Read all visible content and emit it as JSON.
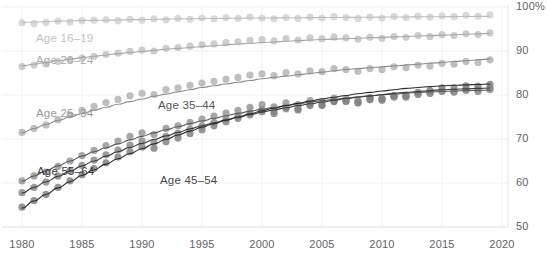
{
  "chart_data": {
    "type": "scatter",
    "title": "",
    "subtitle": "",
    "xlabel": "",
    "ylabel": "",
    "xlim": [
      1979,
      2020.5
    ],
    "ylim": [
      50,
      100
    ],
    "grid": true,
    "legend_position": "inline-labels",
    "y_ticks": [
      {
        "value": 100,
        "label": "100%"
      },
      {
        "value": 90,
        "label": "90"
      },
      {
        "value": 80,
        "label": "80"
      },
      {
        "value": 70,
        "label": "70"
      },
      {
        "value": 60,
        "label": "60"
      },
      {
        "value": 50,
        "label": "50"
      }
    ],
    "x_ticks": [
      {
        "value": 1980,
        "label": "1980"
      },
      {
        "value": 1985,
        "label": "1985"
      },
      {
        "value": 1990,
        "label": "1990"
      },
      {
        "value": 1995,
        "label": "1995"
      },
      {
        "value": 2000,
        "label": "2000"
      },
      {
        "value": 2005,
        "label": "2005"
      },
      {
        "value": 2010,
        "label": "2010"
      },
      {
        "value": 2015,
        "label": "2015"
      },
      {
        "value": 2020,
        "label": "2020"
      }
    ],
    "x": [
      1980,
      1981,
      1982,
      1983,
      1984,
      1985,
      1986,
      1987,
      1988,
      1989,
      1990,
      1991,
      1992,
      1993,
      1994,
      1995,
      1996,
      1997,
      1998,
      1999,
      2000,
      2001,
      2002,
      2003,
      2004,
      2005,
      2006,
      2007,
      2008,
      2009,
      2010,
      2011,
      2012,
      2013,
      2014,
      2015,
      2016,
      2017,
      2018,
      2019
    ],
    "series": [
      {
        "name": "Age 16-19",
        "label": "Age 16–19",
        "color": "#d2d2d4",
        "line_color": "#bdbdbf",
        "label_color": "#c2c2c4",
        "label_x": 36,
        "label_y": 32,
        "values": [
          96.4,
          96.2,
          96.5,
          96.8,
          96.6,
          96.9,
          97.0,
          97.1,
          96.9,
          97.2,
          97.0,
          97.3,
          97.1,
          97.4,
          97.2,
          97.5,
          97.3,
          97.6,
          97.4,
          97.7,
          97.5,
          97.3,
          97.6,
          97.4,
          97.7,
          97.5,
          97.8,
          97.6,
          97.4,
          97.7,
          97.5,
          97.8,
          97.6,
          97.9,
          97.7,
          98.0,
          97.8,
          98.1,
          97.9,
          98.2
        ],
        "fit": [
          96.5,
          96.6,
          96.7,
          96.8,
          96.85,
          96.9,
          96.95,
          97.0,
          97.05,
          97.1,
          97.15,
          97.2,
          97.25,
          97.3,
          97.33,
          97.36,
          97.39,
          97.42,
          97.45,
          97.48,
          97.5,
          97.52,
          97.54,
          97.56,
          97.58,
          97.6,
          97.62,
          97.64,
          97.66,
          97.68,
          97.7,
          97.72,
          97.74,
          97.76,
          97.78,
          97.8,
          97.82,
          97.84,
          97.86,
          97.88
        ]
      },
      {
        "name": "Age 20-24",
        "label": "Age 20–24",
        "color": "#c4c4c6",
        "line_color": "#a8a8aa",
        "label_color": "#a9a9ab",
        "label_x": 36,
        "label_y": 54,
        "values": [
          86.5,
          86.8,
          87.0,
          87.6,
          88.0,
          88.4,
          88.8,
          89.2,
          89.5,
          89.9,
          90.2,
          90.0,
          90.6,
          90.8,
          91.1,
          91.4,
          91.6,
          91.9,
          92.1,
          92.4,
          92.6,
          92.3,
          92.8,
          92.5,
          93.0,
          92.8,
          93.2,
          93.0,
          92.7,
          93.1,
          92.9,
          93.3,
          93.1,
          93.5,
          93.3,
          93.7,
          93.5,
          93.9,
          93.7,
          94.1
        ],
        "fit": [
          86.6,
          87.0,
          87.4,
          87.8,
          88.15,
          88.5,
          88.8,
          89.1,
          89.4,
          89.65,
          89.9,
          90.15,
          90.4,
          90.6,
          90.8,
          91.0,
          91.2,
          91.4,
          91.6,
          91.75,
          91.9,
          92.05,
          92.2,
          92.35,
          92.5,
          92.6,
          92.7,
          92.8,
          92.9,
          93.0,
          93.1,
          93.2,
          93.3,
          93.4,
          93.5,
          93.6,
          93.7,
          93.8,
          93.9,
          94.0
        ]
      },
      {
        "name": "Age 25-34",
        "label": "Age 25–34",
        "color": "#b4b4b6",
        "line_color": "#8e8e90",
        "label_color": "#97979a",
        "label_x": 36,
        "label_y": 107,
        "values": [
          71.5,
          72.4,
          73.2,
          74.4,
          75.5,
          76.5,
          77.4,
          78.3,
          79.0,
          79.8,
          80.4,
          80.1,
          81.2,
          81.6,
          82.2,
          82.7,
          83.1,
          83.6,
          84.0,
          84.5,
          84.8,
          84.4,
          85.1,
          84.8,
          85.5,
          85.3,
          86.0,
          85.8,
          85.4,
          86.0,
          85.8,
          86.4,
          86.2,
          86.8,
          86.6,
          87.2,
          87.0,
          87.6,
          87.4,
          88.0
        ],
        "fit": [
          71.4,
          72.4,
          73.3,
          74.2,
          75.0,
          75.8,
          76.5,
          77.2,
          77.9,
          78.5,
          79.1,
          79.7,
          80.2,
          80.7,
          81.2,
          81.7,
          82.1,
          82.5,
          82.9,
          83.3,
          83.7,
          84.0,
          84.3,
          84.6,
          84.9,
          85.2,
          85.5,
          85.8,
          86.0,
          86.2,
          86.4,
          86.6,
          86.8,
          87.0,
          87.2,
          87.4,
          87.6,
          87.8,
          88.0,
          88.2
        ]
      },
      {
        "name": "Age 35-44",
        "label": "Age 35–44",
        "color": "#979799",
        "line_color": "#5a5a5c",
        "label_color": "#56565a",
        "label_x": 158,
        "label_y": 99,
        "values": [
          60.5,
          61.6,
          62.5,
          63.8,
          65.0,
          66.2,
          67.4,
          68.5,
          69.5,
          70.6,
          71.4,
          71.0,
          72.4,
          73.0,
          73.8,
          74.5,
          75.2,
          75.9,
          76.5,
          77.2,
          77.8,
          77.3,
          78.2,
          77.8,
          78.7,
          78.5,
          79.3,
          79.2,
          78.8,
          79.4,
          79.2,
          79.8,
          79.7,
          80.2,
          80.4,
          80.8,
          80.6,
          81.0,
          80.8,
          81.2
        ],
        "fit": [
          60.4,
          61.6,
          62.8,
          63.9,
          65.0,
          66.1,
          67.1,
          68.0,
          68.9,
          69.8,
          70.6,
          71.4,
          72.1,
          72.8,
          73.5,
          74.1,
          74.7,
          75.3,
          75.8,
          76.3,
          76.8,
          77.2,
          77.6,
          78.0,
          78.4,
          78.7,
          79.0,
          79.3,
          79.6,
          79.8,
          80.0,
          80.2,
          80.4,
          80.6,
          80.7,
          80.8,
          80.9,
          81.0,
          81.05,
          81.1
        ]
      },
      {
        "name": "Age 45-54",
        "label": "Age 45–54",
        "color": "#8c8c8e",
        "line_color": "#3c3c3e",
        "label_color": "#4a4a4e",
        "label_x": 160,
        "label_y": 174,
        "values": [
          57.8,
          59.0,
          60.2,
          61.6,
          62.8,
          64.0,
          65.2,
          66.4,
          67.5,
          68.6,
          69.6,
          69.2,
          70.6,
          71.3,
          72.2,
          73.0,
          73.8,
          74.6,
          75.3,
          76.0,
          76.7,
          76.2,
          77.2,
          76.9,
          77.9,
          77.8,
          78.6,
          78.6,
          78.2,
          78.9,
          78.8,
          79.5,
          79.5,
          80.1,
          80.4,
          80.9,
          80.8,
          81.3,
          81.1,
          81.6
        ],
        "fit": [
          57.7,
          59.0,
          60.3,
          61.5,
          62.7,
          63.9,
          65.0,
          66.1,
          67.1,
          68.1,
          69.0,
          69.9,
          70.7,
          71.5,
          72.3,
          73.0,
          73.7,
          74.3,
          74.9,
          75.5,
          76.1,
          76.6,
          77.1,
          77.6,
          78.0,
          78.4,
          78.8,
          79.2,
          79.5,
          79.8,
          80.1,
          80.4,
          80.6,
          80.8,
          81.0,
          81.2,
          81.3,
          81.4,
          81.5,
          81.6
        ]
      },
      {
        "name": "Age 55-64",
        "label": "Age 55–64",
        "color": "#838385",
        "line_color": "#2a2a2c",
        "label_color": "#3a3a3e",
        "label_x": 37,
        "label_y": 165,
        "values": [
          54.5,
          56.0,
          57.4,
          59.0,
          60.5,
          61.9,
          63.3,
          64.6,
          65.9,
          67.1,
          68.2,
          67.9,
          69.4,
          70.2,
          71.2,
          72.1,
          73.0,
          73.9,
          74.7,
          75.5,
          76.2,
          75.8,
          76.9,
          76.6,
          77.6,
          77.6,
          78.5,
          78.6,
          78.3,
          79.1,
          79.1,
          79.8,
          79.9,
          80.6,
          81.0,
          81.6,
          81.6,
          82.1,
          82.0,
          82.4
        ],
        "fit": [
          54.3,
          55.9,
          57.4,
          58.9,
          60.3,
          61.7,
          63.0,
          64.3,
          65.5,
          66.7,
          67.8,
          68.9,
          69.9,
          70.9,
          71.8,
          72.7,
          73.5,
          74.3,
          75.0,
          75.7,
          76.4,
          77.0,
          77.6,
          78.1,
          78.6,
          79.1,
          79.5,
          79.9,
          80.3,
          80.6,
          80.9,
          81.2,
          81.5,
          81.7,
          81.9,
          82.1,
          82.2,
          82.3,
          82.4,
          82.5
        ]
      }
    ]
  }
}
